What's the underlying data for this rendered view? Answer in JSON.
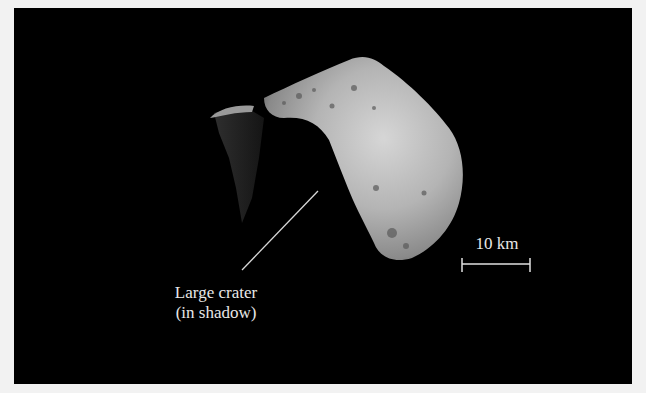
{
  "image": {
    "subject": "asteroid",
    "background_color": "#000000",
    "frame_color": "#f2f2f2"
  },
  "annotations": {
    "crater_label_line1": "Large crater",
    "crater_label_line2": "(in shadow)",
    "scale_bar_label": "10 km"
  }
}
